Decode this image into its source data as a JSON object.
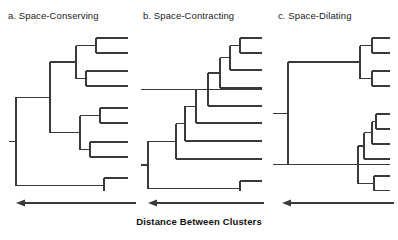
{
  "figure": {
    "width": 398,
    "height": 240,
    "background": "#ffffff",
    "line_color": "#3a3a3a",
    "text_color": "#1a1a1a",
    "axis_caption": "Distance Between Clusters"
  },
  "panels": [
    {
      "id": "space-conserving",
      "title": "a. Space-Conserving",
      "left": 8,
      "title_left": 8,
      "tree_width": 128,
      "tree_height": 165,
      "axis": {
        "left": 14,
        "right": 128,
        "y": 8,
        "direction": "left"
      }
    },
    {
      "id": "space-contracting",
      "title": "b. Space-Contracting",
      "left": 140,
      "title_left": 143,
      "tree_width": 128,
      "tree_height": 165,
      "axis": {
        "left": 14,
        "right": 124,
        "y": 8,
        "direction": "left"
      }
    },
    {
      "id": "space-dilating",
      "title": "c. Space-Dilating",
      "left": 272,
      "title_left": 278,
      "tree_width": 126,
      "tree_height": 165,
      "axis": {
        "left": 16,
        "right": 122,
        "y": 8,
        "direction": "left"
      }
    }
  ],
  "chart_data": {
    "type": "dendrogram-figure",
    "title": "",
    "xlabel": "Distance Between Clusters",
    "xaxis_direction": "right-to-left (distance increases leftward)",
    "panel_count": 3,
    "leaf_count_per_panel": 8,
    "dendrograms": [
      {
        "name": "a. Space-Conserving",
        "description": "Balanced dendrogram; merge distances spread evenly across the range.",
        "leaf_x": 120,
        "leaf_y": [
          12,
          27,
          45,
          60,
          82,
          97,
          116,
          131,
          152,
          167
        ],
        "leaves": 10,
        "merges": [
          {
            "id": "m1",
            "x": 88,
            "children_y": [
              12,
              27
            ]
          },
          {
            "id": "m2",
            "x": 78,
            "children_y": [
              45,
              60
            ]
          },
          {
            "id": "m3",
            "x": 68,
            "children_y": [
              19.5,
              52.5
            ]
          },
          {
            "id": "m4",
            "x": 92,
            "children_y": [
              82,
              97
            ]
          },
          {
            "id": "m5",
            "x": 82,
            "children_y": [
              116,
              131
            ]
          },
          {
            "id": "m6",
            "x": 72,
            "children_y": [
              89.5,
              123.5
            ]
          },
          {
            "id": "m7",
            "x": 42,
            "children_y": [
              36,
              106.5
            ]
          },
          {
            "id": "m8",
            "x": 96,
            "children_y": [
              152,
              167
            ]
          },
          {
            "id": "m9",
            "x": 8,
            "children_y": [
              71.25,
              159.5
            ]
          }
        ]
      },
      {
        "name": "b. Space-Contracting",
        "description": "Chaining: clusters merge one at a time in a staircase near small distances.",
        "leaf_x": 122,
        "leaf_y": [
          12,
          27,
          44,
          62,
          80,
          97,
          115,
          133,
          155,
          170
        ],
        "leaves": 10,
        "merges": [
          {
            "id": "m1",
            "x": 100,
            "children_y": [
              12,
              27
            ]
          },
          {
            "id": "m2",
            "x": 90,
            "children_y": [
              19.5,
              44
            ]
          },
          {
            "id": "m3",
            "x": 80,
            "children_y": [
              31.75,
              62
            ]
          },
          {
            "id": "m4",
            "x": 68,
            "children_y": [
              46.875,
              80
            ]
          },
          {
            "id": "m5",
            "x": 56,
            "children_y": [
              63.4,
              97
            ]
          },
          {
            "id": "m6",
            "x": 45,
            "children_y": [
              80.2,
              115
            ]
          },
          {
            "id": "m7",
            "x": 36,
            "children_y": [
              97.6,
              133
            ]
          },
          {
            "id": "m8",
            "x": 100,
            "children_y": [
              155,
              170
            ]
          },
          {
            "id": "m9",
            "x": 8,
            "children_y": [
              115.3,
              162.5
            ]
          }
        ]
      },
      {
        "name": "c. Space-Dilating",
        "description": "Dilating: tight sub-clusters at small distance, then a very large final merge.",
        "leaf_x": 118,
        "leaf_y": [
          12,
          27,
          45,
          60,
          88,
          103,
          118,
          133,
          150,
          165
        ],
        "leaves": 10,
        "merges": [
          {
            "id": "m1",
            "x": 100,
            "children_y": [
              12,
              27
            ]
          },
          {
            "id": "m2",
            "x": 100,
            "children_y": [
              45,
              60
            ]
          },
          {
            "id": "m3",
            "x": 88,
            "children_y": [
              19.5,
              52.5
            ]
          },
          {
            "id": "m4",
            "x": 104,
            "children_y": [
              88,
              103
            ]
          },
          {
            "id": "m5",
            "x": 100,
            "children_y": [
              95.5,
              118
            ]
          },
          {
            "id": "m6",
            "x": 92,
            "children_y": [
              106.75,
              133
            ]
          },
          {
            "id": "m7",
            "x": 102,
            "children_y": [
              150,
              165
            ]
          },
          {
            "id": "m8",
            "x": 86,
            "children_y": [
              119.875,
              157.5
            ]
          },
          {
            "id": "m9",
            "x": 16,
            "children_y": [
              36,
              138.7
            ]
          }
        ]
      }
    ]
  }
}
